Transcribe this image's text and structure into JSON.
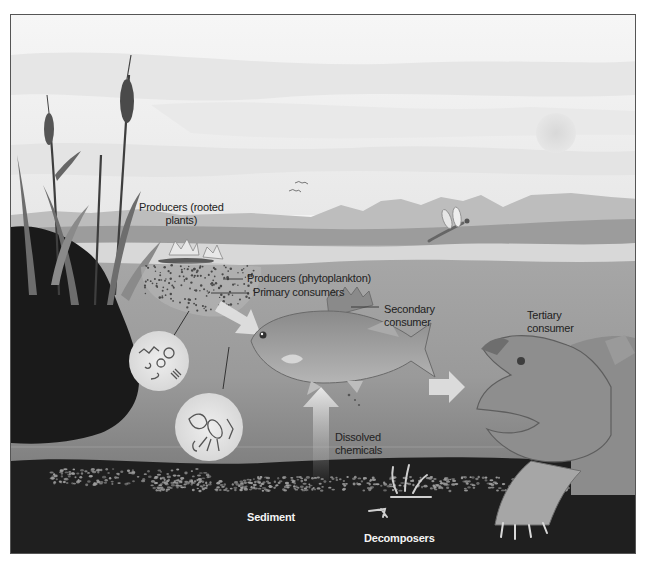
{
  "figure": {
    "palette": {
      "sky": "#f1f1f1",
      "sky_band": "#e4e4e4",
      "far_hills": "#b9b9b9",
      "near_bank": "#9a9a9a",
      "water_surface": "#d9d9d9",
      "water": "#9e9e9e",
      "water_deep": "#7d7d7d",
      "sediment": "#1e1e1e",
      "rock_bank": "#1a1a1a",
      "arrow": "#e6e6e6"
    }
  },
  "labels": {
    "producers_rooted_line1": "Producers (rooted",
    "producers_rooted_line2": "plants)",
    "producers_phytoplankton": "Producers (phytoplankton)",
    "primary_consumers": "Primary consumers",
    "secondary_consumer_line1": "Secondary",
    "secondary_consumer_line2": "consumer",
    "tertiary_consumer_line1": "Tertiary",
    "tertiary_consumer_line2": "consumer",
    "dissolved_chemicals_line1": "Dissolved",
    "dissolved_chemicals_line2": "chemicals",
    "sediment": "Sediment",
    "decomposers": "Decomposers"
  },
  "illustrations": [
    "cattail-reeds",
    "sun",
    "birds",
    "dragonfly",
    "water-lilies",
    "phytoplankton-cloud",
    "magnified-phytoplankton-circle",
    "magnified-zooplankton-circle",
    "perch-fish",
    "snapping-turtle",
    "decomposer-bones",
    "rock-bank",
    "flow-arrows"
  ]
}
